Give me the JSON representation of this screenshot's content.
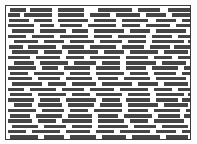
{
  "document": {
    "title": "Greeked Text Block",
    "description": "Placeholder block of illegible (greeked) text lines inside a thin rectangular frame",
    "kind": "text-placeholder"
  },
  "colors": {
    "page_background": "#fdfdfd",
    "block_background": "#ffffff",
    "frame_border": "#3c3c3c",
    "bar_fill": "#454545"
  },
  "frame": {
    "x": 5,
    "y": 5,
    "width": 186,
    "height": 135,
    "border_width": 1
  },
  "metrics": {
    "row_count": 25,
    "row_pitch": 5.3,
    "bar_height": 3.6,
    "first_row_y": 2.0
  },
  "rows": [
    {
      "y": 2.0,
      "bars": [
        [
          4,
          16
        ],
        [
          24,
          22
        ],
        [
          52,
          26
        ],
        [
          92,
          34
        ],
        [
          132,
          22
        ],
        [
          162,
          22
        ]
      ]
    },
    {
      "y": 7.3,
      "bars": [
        [
          2,
          12
        ],
        [
          18,
          28
        ],
        [
          52,
          26
        ],
        [
          84,
          20
        ],
        [
          110,
          24
        ],
        [
          140,
          20
        ],
        [
          166,
          18
        ]
      ]
    },
    {
      "y": 12.6,
      "bars": [
        [
          3,
          20
        ],
        [
          28,
          18
        ],
        [
          52,
          30
        ],
        [
          88,
          22
        ],
        [
          116,
          26
        ],
        [
          150,
          20
        ],
        [
          176,
          9
        ]
      ]
    },
    {
      "y": 17.9,
      "bars": [
        [
          2,
          26
        ],
        [
          34,
          14
        ],
        [
          54,
          22
        ],
        [
          82,
          28
        ],
        [
          116,
          18
        ],
        [
          140,
          24
        ],
        [
          170,
          15
        ]
      ]
    },
    {
      "y": 23.2,
      "bars": [
        [
          6,
          22
        ],
        [
          34,
          26
        ],
        [
          66,
          16
        ],
        [
          88,
          30
        ],
        [
          124,
          20
        ],
        [
          150,
          30
        ]
      ]
    },
    {
      "y": 28.5,
      "bars": [
        [
          2,
          18
        ],
        [
          26,
          22
        ],
        [
          54,
          28
        ],
        [
          88,
          18
        ],
        [
          112,
          28
        ],
        [
          146,
          20
        ],
        [
          172,
          13
        ]
      ]
    },
    {
      "y": 33.8,
      "bars": [
        [
          8,
          24
        ],
        [
          38,
          20
        ],
        [
          64,
          24
        ],
        [
          94,
          22
        ],
        [
          122,
          18
        ],
        [
          146,
          32
        ],
        [
          182,
          4
        ]
      ]
    },
    {
      "y": 39.1,
      "bars": [
        [
          3,
          14
        ],
        [
          22,
          28
        ],
        [
          56,
          22
        ],
        [
          84,
          26
        ],
        [
          116,
          22
        ],
        [
          144,
          20
        ],
        [
          168,
          16
        ]
      ]
    },
    {
      "y": 44.4,
      "bars": [
        [
          6,
          26
        ],
        [
          38,
          18
        ],
        [
          62,
          30
        ],
        [
          98,
          20
        ],
        [
          124,
          28
        ],
        [
          158,
          24
        ]
      ]
    },
    {
      "y": 49.7,
      "bars": [
        [
          2,
          22
        ],
        [
          30,
          24
        ],
        [
          60,
          18
        ],
        [
          84,
          30
        ],
        [
          120,
          22
        ],
        [
          148,
          18
        ],
        [
          172,
          13
        ]
      ]
    },
    {
      "y": 55.0,
      "bars": [
        [
          8,
          20
        ],
        [
          34,
          28
        ],
        [
          68,
          22
        ],
        [
          96,
          18
        ],
        [
          120,
          30
        ],
        [
          156,
          24
        ],
        [
          184,
          2
        ]
      ]
    },
    {
      "y": 60.3,
      "bars": [
        [
          2,
          28
        ],
        [
          36,
          16
        ],
        [
          58,
          26
        ],
        [
          90,
          24
        ],
        [
          120,
          20
        ],
        [
          146,
          26
        ],
        [
          178,
          7
        ]
      ]
    },
    {
      "y": 65.6,
      "bars": [
        [
          4,
          18
        ],
        [
          28,
          30
        ],
        [
          64,
          20
        ],
        [
          90,
          28
        ],
        [
          124,
          18
        ],
        [
          148,
          22
        ],
        [
          176,
          9
        ]
      ]
    },
    {
      "y": 70.9,
      "bars": [
        [
          2,
          24
        ],
        [
          32,
          22
        ],
        [
          60,
          26
        ],
        [
          92,
          20
        ],
        [
          118,
          26
        ],
        [
          150,
          30
        ]
      ]
    },
    {
      "y": 76.2,
      "bars": [
        [
          6,
          30
        ],
        [
          42,
          18
        ],
        [
          66,
          24
        ],
        [
          96,
          30
        ],
        [
          132,
          20
        ],
        [
          158,
          24
        ]
      ]
    },
    {
      "y": 81.5,
      "bars": [
        [
          2,
          16
        ],
        [
          24,
          26
        ],
        [
          56,
          22
        ],
        [
          84,
          24
        ],
        [
          114,
          28
        ],
        [
          148,
          18
        ],
        [
          172,
          13
        ]
      ]
    },
    {
      "y": 86.8,
      "bars": [
        [
          4,
          22
        ],
        [
          32,
          28
        ],
        [
          66,
          18
        ],
        [
          90,
          26
        ],
        [
          122,
          22
        ],
        [
          150,
          28
        ],
        [
          182,
          4
        ]
      ]
    },
    {
      "y": 92.1,
      "bars": [
        [
          2,
          26
        ],
        [
          34,
          20
        ],
        [
          60,
          30
        ],
        [
          96,
          18
        ],
        [
          120,
          24
        ],
        [
          150,
          22
        ],
        [
          176,
          9
        ]
      ]
    },
    {
      "y": 97.4,
      "bars": [
        [
          8,
          18
        ],
        [
          32,
          24
        ],
        [
          62,
          26
        ],
        [
          94,
          22
        ],
        [
          122,
          30
        ],
        [
          158,
          24
        ]
      ]
    },
    {
      "y": 102.7,
      "bars": [
        [
          2,
          28
        ],
        [
          36,
          22
        ],
        [
          64,
          18
        ],
        [
          88,
          28
        ],
        [
          122,
          20
        ],
        [
          148,
          26
        ],
        [
          180,
          5
        ]
      ]
    },
    {
      "y": 108.0,
      "bars": [
        [
          4,
          20
        ],
        [
          30,
          26
        ],
        [
          62,
          24
        ],
        [
          92,
          20
        ],
        [
          118,
          28
        ],
        [
          152,
          22
        ],
        [
          178,
          7
        ]
      ]
    },
    {
      "y": 113.3,
      "bars": [
        [
          2,
          24
        ],
        [
          32,
          18
        ],
        [
          56,
          30
        ],
        [
          92,
          26
        ],
        [
          124,
          18
        ],
        [
          148,
          30
        ]
      ]
    },
    {
      "y": 118.6,
      "bars": [
        [
          6,
          26
        ],
        [
          38,
          22
        ],
        [
          66,
          20
        ],
        [
          92,
          30
        ],
        [
          128,
          22
        ],
        [
          156,
          26
        ]
      ]
    },
    {
      "y": 123.9,
      "bars": [
        [
          2,
          18
        ],
        [
          26,
          28
        ],
        [
          60,
          24
        ],
        [
          90,
          18
        ],
        [
          114,
          30
        ],
        [
          150,
          20
        ],
        [
          176,
          9
        ]
      ]
    },
    {
      "y": 129.2,
      "bars": [
        [
          4,
          28
        ],
        [
          38,
          20
        ],
        [
          64,
          26
        ],
        [
          96,
          24
        ],
        [
          126,
          28
        ],
        [
          160,
          22
        ]
      ]
    }
  ]
}
